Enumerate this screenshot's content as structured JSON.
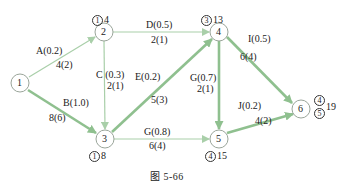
{
  "colors": {
    "edge": "#a9cfa9",
    "edge_critical": "#8fc08f",
    "node_stroke": "#9aa59a"
  },
  "nodes": [
    {
      "id": "1",
      "label": "1",
      "x": 20,
      "y": 83
    },
    {
      "id": "2",
      "label": "2",
      "x": 104,
      "y": 32
    },
    {
      "id": "3",
      "label": "3",
      "x": 105,
      "y": 139
    },
    {
      "id": "4",
      "label": "4",
      "x": 219,
      "y": 32
    },
    {
      "id": "5",
      "label": "5",
      "x": 219,
      "y": 139
    },
    {
      "id": "6",
      "label": "6",
      "x": 301,
      "y": 109
    }
  ],
  "node_annotations": {
    "n2": {
      "circle": "1",
      "value": "4"
    },
    "n4": {
      "circle": "3",
      "value": "13"
    },
    "n3": {
      "circle": "1",
      "value": "8"
    },
    "n5": {
      "circle": "4",
      "value": "15"
    },
    "n6": {
      "circle_top": "4",
      "circle_bottom": "5",
      "value": "19"
    }
  },
  "edges": [
    {
      "from": "1",
      "to": "2",
      "name": "A(0.2)",
      "time": "4(2)",
      "critical": false
    },
    {
      "from": "1",
      "to": "3",
      "name": "B(1.0)",
      "time": "8(6)",
      "critical": true
    },
    {
      "from": "2",
      "to": "3",
      "name": "C (0.3)",
      "time": "2(1)",
      "critical": false
    },
    {
      "from": "2",
      "to": "4",
      "name": "D(0.5)",
      "time": "2(1)",
      "critical": false
    },
    {
      "from": "3",
      "to": "4",
      "name": "E(0.2)",
      "time": "5(3)",
      "critical": true
    },
    {
      "from": "3",
      "to": "5",
      "name": "G(0.8)",
      "time": "6(4)",
      "critical": false
    },
    {
      "from": "4",
      "to": "5",
      "name": "G(0.7)",
      "time": "2(1)",
      "critical": true
    },
    {
      "from": "4",
      "to": "6",
      "name": "I(0.5)",
      "time": "6(4)",
      "critical": true
    },
    {
      "from": "5",
      "to": "6",
      "name": "J(0.2)",
      "time": "4(2)",
      "critical": true
    }
  ],
  "caption": "图    5-66"
}
